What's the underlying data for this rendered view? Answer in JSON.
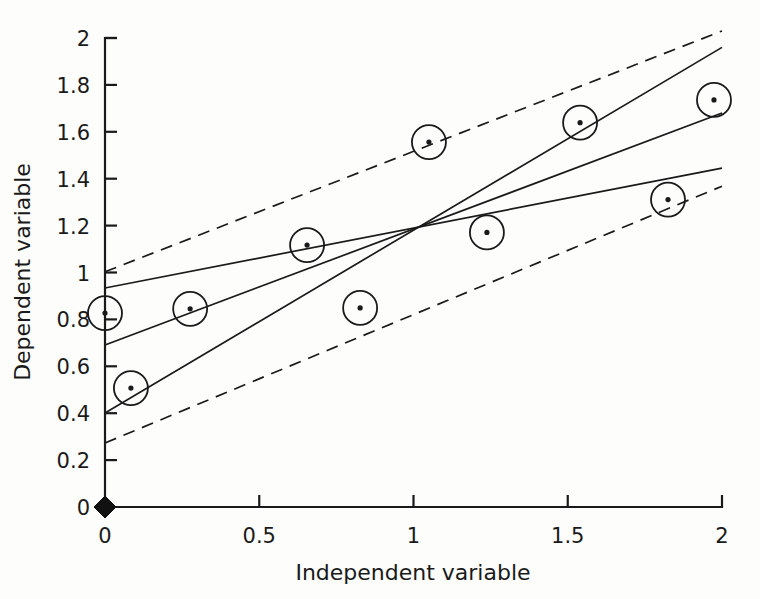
{
  "figure": {
    "background_color": "#fdfdfc",
    "ink_color": "#1a1a1a",
    "width": 760,
    "height": 599
  },
  "chart_data": {
    "type": "scatter",
    "title": "",
    "subtitle": "",
    "xlabel": "Independent variable",
    "ylabel": "Dependent variable",
    "xlim": [
      0,
      2
    ],
    "ylim": [
      0,
      2
    ],
    "xticks": [
      0,
      0.5,
      1,
      1.5,
      2
    ],
    "xtick_labels": [
      "0",
      "0.5",
      "1",
      "1.5",
      "2"
    ],
    "yticks": [
      0,
      0.2,
      0.4,
      0.6,
      0.8,
      1,
      1.2,
      1.4,
      1.6,
      1.8,
      2
    ],
    "ytick_labels": [
      "0",
      "0.2",
      "0.4",
      "0.6",
      "0.8",
      "1",
      "1.2",
      "1.4",
      "1.6",
      "1.8",
      "2"
    ],
    "grid": false,
    "legend": false,
    "legend_position": "none",
    "marker_style": "open-circle-with-center-dot",
    "points": [
      {
        "x": 0.0,
        "y": 0.827
      },
      {
        "x": 0.084,
        "y": 0.507
      },
      {
        "x": 0.276,
        "y": 0.845
      },
      {
        "x": 0.655,
        "y": 1.117
      },
      {
        "x": 0.827,
        "y": 0.849
      },
      {
        "x": 1.05,
        "y": 1.556
      },
      {
        "x": 1.238,
        "y": 1.171
      },
      {
        "x": 1.54,
        "y": 1.639
      },
      {
        "x": 1.825,
        "y": 1.311
      },
      {
        "x": 1.974,
        "y": 1.736
      }
    ],
    "origin_marker": {
      "x": 0.0,
      "y": 0.0,
      "style": "filled-diamond"
    },
    "series": [
      {
        "name": "upper confidence band",
        "style": "dashed",
        "x": [
          0.0,
          2.0
        ],
        "values": [
          1.003,
          2.03
        ]
      },
      {
        "name": "shallow fit line",
        "style": "solid",
        "x": [
          0.0,
          2.0
        ],
        "values": [
          0.934,
          1.445
        ]
      },
      {
        "name": "central regression line",
        "style": "solid",
        "x": [
          0.0,
          2.0
        ],
        "values": [
          0.691,
          1.68
        ]
      },
      {
        "name": "steep fit line",
        "style": "solid",
        "x": [
          0.0,
          2.0
        ],
        "values": [
          0.401,
          1.96
        ]
      },
      {
        "name": "lower confidence band",
        "style": "dashed",
        "x": [
          0.0,
          2.0
        ],
        "values": [
          0.273,
          1.368
        ]
      }
    ],
    "convergence_point": {
      "x": 1.005,
      "y": 1.195
    }
  }
}
